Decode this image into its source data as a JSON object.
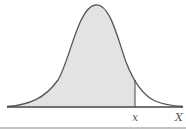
{
  "diagram": {
    "type": "normal-distribution-curve",
    "shaded_region": "area under curve left of x",
    "labels": {
      "cutoff": "x",
      "axis": "X"
    },
    "colors": {
      "curve": "#555555",
      "fill": "#e3e3e3",
      "axis": "#444444",
      "rule": "#888888"
    }
  }
}
